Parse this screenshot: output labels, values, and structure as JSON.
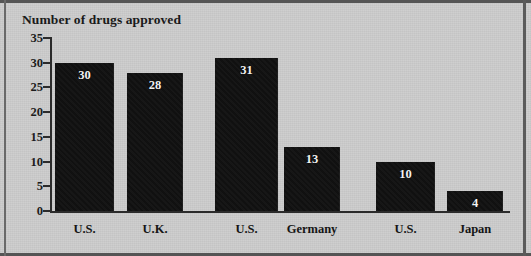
{
  "chart_data": {
    "type": "bar",
    "title": "Number of drugs approved",
    "xlabel": "",
    "ylabel": "Number of drugs approved",
    "categories": [
      "U.S.",
      "U.K.",
      "U.S.",
      "Germany",
      "U.S.",
      "Japan"
    ],
    "values": [
      30,
      28,
      31,
      13,
      10,
      4
    ],
    "data_labels": [
      "30",
      "28",
      "31",
      "13",
      "10",
      "4"
    ],
    "ylim": [
      0,
      35
    ],
    "ytick_labels": [
      "35",
      "30",
      "25",
      "20",
      "15",
      "10",
      "5",
      "0"
    ],
    "ytick_values": [
      35,
      30,
      25,
      20,
      15,
      10,
      5,
      0
    ],
    "grid": false,
    "legend": null,
    "legend_position": "none",
    "series": [
      {
        "name": "Number of drugs approved",
        "values": [
          30,
          28,
          31,
          13,
          10,
          4
        ]
      }
    ]
  },
  "style": {
    "background_color": "#cdcdcd",
    "bar_color": "#111111",
    "axis_color": "#2b2b2b",
    "text_color": "#1a1a1a",
    "bar_label_color": "#f2f2f2",
    "border_color": "#555555"
  }
}
